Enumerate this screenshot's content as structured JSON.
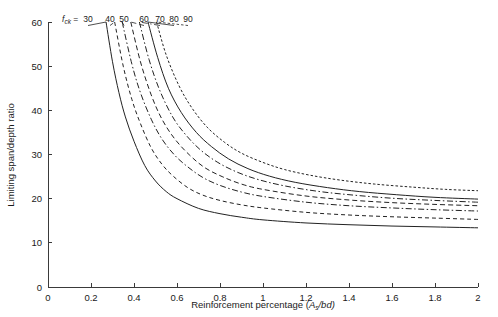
{
  "chart_data": {
    "type": "line",
    "title": "",
    "xlabel": "Reinforcement percentage (As/bd)",
    "xlabel_main": "Reinforcement percentage (",
    "xlabel_var": "A",
    "xlabel_sub": "s",
    "xlabel_tail": "/bd)",
    "ylabel": "Limiting span/depth ratio",
    "xlim": [
      0,
      2
    ],
    "ylim": [
      0,
      60
    ],
    "xticks": [
      0,
      0.2,
      0.4,
      0.6,
      0.8,
      1,
      1.2,
      1.4,
      1.6,
      1.8,
      2
    ],
    "xtick_labels": [
      "0",
      "0.2",
      "0.4",
      "0.6",
      "0.8",
      "1",
      "1.2",
      "1.4",
      "1.6",
      "1.8",
      "2"
    ],
    "yticks": [
      0,
      10,
      20,
      30,
      40,
      50,
      60
    ],
    "ytick_labels": [
      "0",
      "10",
      "20",
      "30",
      "40",
      "50",
      "60"
    ],
    "grid": false,
    "legend_position": "top-left-inline",
    "legend_prefix_var": "f",
    "legend_prefix_sub": "ck",
    "legend_prefix_eq": " = ",
    "legend_values": [
      "30",
      "40",
      "50",
      "60",
      "70",
      "80",
      "90"
    ],
    "series": [
      {
        "name": "30",
        "label": "30",
        "style": "solid",
        "dasharray": "none",
        "x": [
          0.27,
          0.3,
          0.33,
          0.36,
          0.4,
          0.45,
          0.5,
          0.55,
          0.6,
          0.7,
          0.8,
          0.9,
          1.0,
          1.2,
          1.4,
          1.6,
          1.8,
          2.0
        ],
        "y": [
          60.0,
          51.0,
          44.0,
          38.5,
          33.0,
          27.5,
          24.0,
          21.6,
          20.0,
          17.8,
          16.6,
          15.8,
          15.2,
          14.5,
          14.1,
          13.8,
          13.6,
          13.4
        ]
      },
      {
        "name": "40",
        "label": "40",
        "style": "dashed",
        "dasharray": "4,3",
        "x": [
          0.31,
          0.35,
          0.39,
          0.43,
          0.48,
          0.53,
          0.58,
          0.65,
          0.72,
          0.8,
          0.9,
          1.0,
          1.2,
          1.4,
          1.6,
          1.8,
          2.0
        ],
        "y": [
          60.0,
          50.0,
          42.5,
          37.0,
          31.5,
          27.8,
          25.2,
          22.5,
          20.8,
          19.6,
          18.6,
          17.9,
          16.9,
          16.3,
          15.9,
          15.6,
          15.3
        ]
      },
      {
        "name": "50",
        "label": "50",
        "style": "dash-dot",
        "dasharray": "6,2.5,1.5,2.5",
        "x": [
          0.345,
          0.39,
          0.43,
          0.48,
          0.53,
          0.59,
          0.65,
          0.72,
          0.8,
          0.9,
          1.0,
          1.2,
          1.4,
          1.6,
          1.8,
          2.0
        ],
        "y": [
          60.0,
          50.5,
          44.0,
          38.0,
          33.5,
          29.8,
          27.2,
          24.8,
          23.0,
          21.5,
          20.5,
          19.2,
          18.4,
          17.9,
          17.5,
          17.2
        ]
      },
      {
        "name": "60",
        "label": "60",
        "style": "dashed",
        "dasharray": "5,3",
        "x": [
          0.385,
          0.43,
          0.48,
          0.53,
          0.59,
          0.66,
          0.73,
          0.81,
          0.9,
          1.0,
          1.2,
          1.4,
          1.6,
          1.8,
          2.0
        ],
        "y": [
          60.0,
          51.0,
          43.5,
          38.0,
          33.5,
          29.8,
          27.0,
          25.0,
          23.3,
          22.1,
          20.6,
          19.7,
          19.1,
          18.7,
          18.4
        ]
      },
      {
        "name": "70",
        "label": "70",
        "style": "dash-dot",
        "dasharray": "6,2.5,1.5,2.5",
        "x": [
          0.425,
          0.47,
          0.52,
          0.58,
          0.64,
          0.71,
          0.79,
          0.88,
          0.98,
          1.1,
          1.25,
          1.4,
          1.6,
          1.8,
          2.0
        ],
        "y": [
          60.0,
          51.5,
          44.5,
          38.5,
          34.5,
          31.0,
          28.2,
          26.0,
          24.3,
          22.9,
          21.7,
          20.9,
          20.1,
          19.6,
          19.2
        ]
      },
      {
        "name": "80",
        "label": "80",
        "style": "solid",
        "dasharray": "none",
        "x": [
          0.465,
          0.51,
          0.56,
          0.62,
          0.69,
          0.76,
          0.84,
          0.93,
          1.03,
          1.15,
          1.3,
          1.45,
          1.62,
          1.8,
          2.0
        ],
        "y": [
          60.0,
          52.0,
          45.0,
          39.5,
          35.0,
          31.8,
          29.0,
          26.8,
          25.1,
          23.7,
          22.5,
          21.6,
          20.9,
          20.3,
          19.9
        ]
      },
      {
        "name": "90",
        "label": "90",
        "style": "dotted",
        "dasharray": "2.5,2",
        "x": [
          0.505,
          0.55,
          0.61,
          0.67,
          0.74,
          0.82,
          0.9,
          1.0,
          1.1,
          1.22,
          1.36,
          1.52,
          1.7,
          1.85,
          2.0
        ],
        "y": [
          60.0,
          52.5,
          45.5,
          40.5,
          36.2,
          32.8,
          30.3,
          28.2,
          26.6,
          25.3,
          24.2,
          23.3,
          22.6,
          22.1,
          21.8
        ]
      }
    ]
  },
  "axes_geometry": {
    "plot_left": 48,
    "plot_right": 478,
    "plot_top": 22,
    "plot_bottom": 287
  },
  "legend_ticks": [
    {
      "label": "30",
      "label_x": 88,
      "tip_x": 72
    },
    {
      "label": "40",
      "label_x": 110,
      "tip_x": 101
    },
    {
      "label": "50",
      "label_x": 124,
      "tip_x": 113
    },
    {
      "label": "60",
      "label_x": 144,
      "tip_x": 126
    },
    {
      "label": "70",
      "label_x": 160,
      "tip_x": 139
    },
    {
      "label": "80",
      "label_x": 174,
      "tip_x": 152
    },
    {
      "label": "90",
      "label_x": 188,
      "tip_x": 165
    }
  ],
  "colors": {
    "background": "#ffffff",
    "axis": "#3a3a3a",
    "curve": "#222222",
    "text": "#1a1a1a"
  }
}
